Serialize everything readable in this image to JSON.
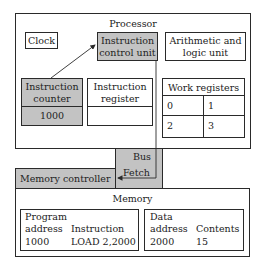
{
  "processor": {
    "title": "Processor",
    "clock": "Clock",
    "icu": {
      "line1": "Instruction",
      "line2": "control unit"
    },
    "alu": {
      "line1": "Arithmetic and",
      "line2": "logic unit"
    },
    "instruction_counter": {
      "line1": "Instruction",
      "line2": "counter",
      "value": "1000"
    },
    "instruction_register": {
      "line1": "Instruction",
      "line2": "register",
      "value": ""
    },
    "work_registers": {
      "title": "Work registers",
      "cells": [
        "0",
        "1",
        "2",
        "3"
      ]
    }
  },
  "bus": {
    "label": "Bus",
    "fetch_label": "Fetch"
  },
  "memory_controller": {
    "label": "Memory controller"
  },
  "memory": {
    "title": "Memory",
    "program": {
      "header1": "Program",
      "col1_header": "address",
      "col2_header": "Instruction",
      "col1_value": "1000",
      "col2_value": "LOAD 2,2000"
    },
    "data": {
      "header1": "Data",
      "col1_header": "address",
      "col2_header": "Contents",
      "col1_value": "2000",
      "col2_value": "15"
    }
  },
  "colors": {
    "gray_fill": "#c3c3c3",
    "line": "#2a2a2a",
    "background": "#ffffff"
  }
}
